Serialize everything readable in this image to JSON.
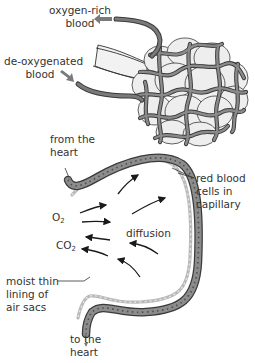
{
  "diagram": {
    "title": "",
    "colors": {
      "vessel": "#6e6e6e",
      "vessel_outline": "#3a3a3a",
      "alveoli_fill": "#eeeeee",
      "airway_fill": "#f2f2f2",
      "capillary_fill": "#8a8a8a",
      "lining": "#c8c8c8",
      "arrow": "#1a1a1a",
      "flow_arrow": "#7a7a7a",
      "text": "#333333"
    },
    "labels": {
      "oxygen_rich": {
        "line1": "oxygen-rich",
        "line2": "blood"
      },
      "deoxygenated": {
        "line1": "de-oxygenated",
        "line2": "blood"
      },
      "from_heart": {
        "line1": "from the",
        "line2": "heart"
      },
      "red_blood_cells": {
        "line1": "red blood",
        "line2": "cells in",
        "line3": "capillary"
      },
      "o2": {
        "symbol": "O",
        "subscript": "2"
      },
      "co2": {
        "symbol": "CO",
        "subscript": "2"
      },
      "diffusion": "diffusion",
      "moist_lining": {
        "line1": "moist thin",
        "line2": "lining of",
        "line3": "air sacs"
      },
      "to_heart": {
        "line1": "to the",
        "line2": "heart"
      }
    },
    "parts": [
      "alveoli cluster with capillary network",
      "bronchiole airway",
      "pulmonary vein (oxygen-rich blood out)",
      "pulmonary artery (de-oxygenated blood in)",
      "capillary wall cross-section",
      "O2 diffusion arrows into capillary",
      "CO2 diffusion arrows out of capillary"
    ]
  }
}
